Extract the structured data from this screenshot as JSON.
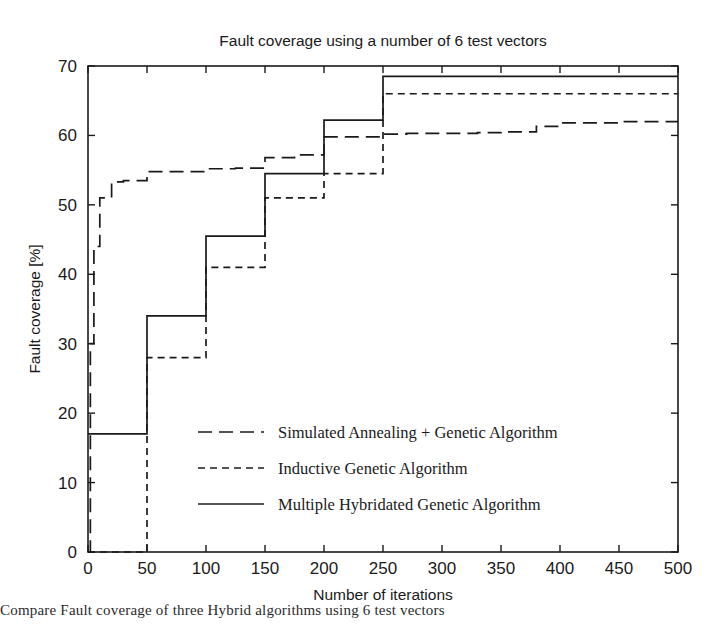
{
  "chart_data": {
    "type": "line",
    "title": "Fault coverage using a number of 6 test vectors",
    "xlabel": "Number of iterations",
    "ylabel": "Fault coverage [%]",
    "xlim": [
      0,
      500
    ],
    "ylim": [
      0,
      70
    ],
    "xticks": [
      0,
      50,
      100,
      150,
      200,
      250,
      300,
      350,
      400,
      450,
      500
    ],
    "yticks": [
      0,
      10,
      20,
      30,
      40,
      50,
      60,
      70
    ],
    "grid": false,
    "legend_position": "center-right-inside",
    "step_style": "post",
    "series": [
      {
        "name": "Simulated Annealing + Genetic Algorithm",
        "line_style": "long-dash",
        "dash_pattern": "14,7",
        "color": "#1a1a1a",
        "x": [
          0,
          2,
          5,
          10,
          20,
          30,
          50,
          100,
          125,
          150,
          175,
          200,
          250,
          270,
          300,
          330,
          350,
          380,
          400,
          450,
          500
        ],
        "y": [
          0,
          30,
          44,
          51,
          53.3,
          53.5,
          54.8,
          55.2,
          55.3,
          56.8,
          57.2,
          59.8,
          60.2,
          60.3,
          60.3,
          60.4,
          60.5,
          61.3,
          61.8,
          62.0,
          62.0
        ]
      },
      {
        "name": "Inductive Genetic Algorithm",
        "line_style": "short-dash",
        "dash_pattern": "7,5",
        "color": "#1a1a1a",
        "x": [
          0,
          50,
          100,
          150,
          200,
          250,
          500
        ],
        "y": [
          0,
          28.0,
          41.0,
          51.0,
          54.5,
          66.0,
          66.0
        ]
      },
      {
        "name": "Multiple Hybridated Genetic Algorithm",
        "line_style": "solid",
        "dash_pattern": "none",
        "color": "#1a1a1a",
        "x": [
          0,
          50,
          100,
          150,
          200,
          250,
          500
        ],
        "y": [
          17.0,
          34.0,
          45.5,
          54.5,
          62.2,
          68.5,
          68.5
        ]
      }
    ]
  },
  "legend": {
    "entries": [
      {
        "label": "Simulated Annealing + Genetic Algorithm",
        "style": "long-dash"
      },
      {
        "label": "Inductive Genetic Algorithm",
        "style": "short-dash"
      },
      {
        "label": "Multiple Hybridated Genetic Algorithm",
        "style": "solid"
      }
    ]
  },
  "caption": {
    "text": "Compare Fault coverage of three Hybrid algorithms using 6 test vectors"
  }
}
